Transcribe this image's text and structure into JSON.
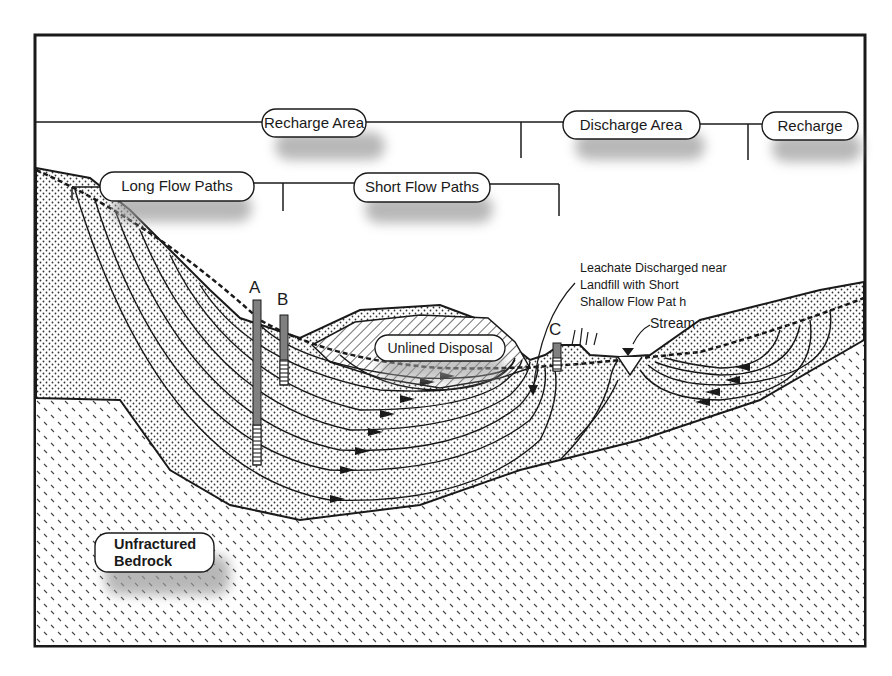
{
  "diagram": {
    "type": "hydrogeologic cross-section",
    "zone_labels": {
      "recharge_area": "Recharge Area",
      "discharge_area": "Discharge Area",
      "recharge_right": "Recharge",
      "long_flow_paths": "Long Flow Paths",
      "short_flow_paths": "Short Flow Paths"
    },
    "features": {
      "unlined_disposal": "Unlined Disposal",
      "stream": "Stream",
      "leachate_note": {
        "line1": "Leachate  Discharged near",
        "line2": "Landfill with Short",
        "line3": "Shallow Flow Pat h"
      },
      "bedrock_line1": "Unfractured",
      "bedrock_line2": "Bedrock"
    },
    "wells": [
      {
        "id": "A",
        "label": "A"
      },
      {
        "id": "B",
        "label": "B"
      },
      {
        "id": "C",
        "label": "C"
      }
    ],
    "colors": {
      "line": "#1a1a1a",
      "shadow": "#9a9a9a",
      "well_casing": "#808080",
      "background": "#ffffff"
    }
  }
}
